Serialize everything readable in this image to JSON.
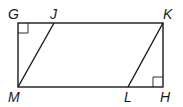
{
  "diagram": {
    "type": "geometry",
    "points": {
      "G": {
        "label": "G",
        "x": 18,
        "y": 23
      },
      "J": {
        "label": "J",
        "x": 54,
        "y": 23
      },
      "K": {
        "label": "K",
        "x": 163,
        "y": 23
      },
      "H": {
        "label": "H",
        "x": 163,
        "y": 87
      },
      "L": {
        "label": "L",
        "x": 128,
        "y": 87
      },
      "M": {
        "label": "M",
        "x": 18,
        "y": 87
      }
    },
    "segments": [
      "GK",
      "KH",
      "HM",
      "MG",
      "MJ",
      "LK"
    ],
    "right_angles": [
      "G",
      "H"
    ],
    "colors": {
      "stroke": "#1a1a1a",
      "background": "#ffffff"
    }
  }
}
